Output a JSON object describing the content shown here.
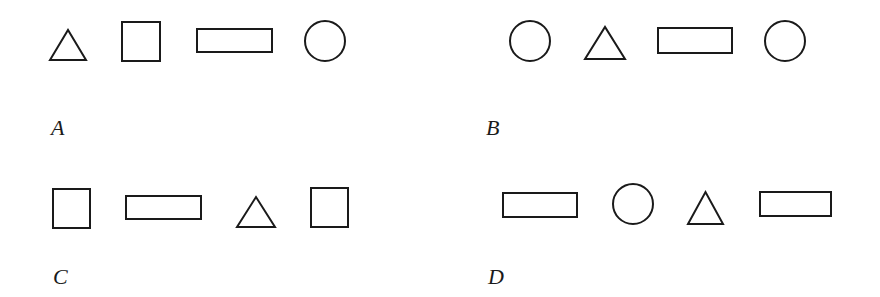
{
  "stroke_color": "#1a1a1a",
  "groups": [
    {
      "label": "A",
      "shapes": [
        "triangle",
        "square",
        "rectangle",
        "circle"
      ]
    },
    {
      "label": "B",
      "shapes": [
        "circle",
        "triangle",
        "rectangle",
        "circle"
      ]
    },
    {
      "label": "C",
      "shapes": [
        "square",
        "rectangle",
        "triangle",
        "square"
      ]
    },
    {
      "label": "D",
      "shapes": [
        "rectangle",
        "circle",
        "triangle",
        "rectangle"
      ]
    }
  ]
}
